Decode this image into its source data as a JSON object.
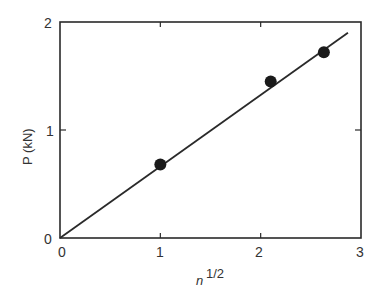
{
  "chart_data": {
    "type": "scatter",
    "title": "",
    "xlabel": "n^{1/2}",
    "xlabel_base": "n",
    "xlabel_sup": "1/2",
    "ylabel": "P (kN)",
    "xlim": [
      0,
      3
    ],
    "ylim": [
      0,
      2
    ],
    "xticks": [
      0,
      1,
      2,
      3
    ],
    "yticks": [
      0,
      1,
      2
    ],
    "grid": false,
    "legend": null,
    "series": [
      {
        "name": "measured",
        "marker": "filled-circle",
        "x": [
          1.0,
          2.1,
          2.63
        ],
        "y": [
          0.68,
          1.45,
          1.72
        ]
      },
      {
        "name": "fit-line",
        "style": "solid-line",
        "x": [
          0,
          2.87
        ],
        "y": [
          0,
          1.9
        ]
      }
    ]
  },
  "axes": {
    "x_tick_labels": [
      "0",
      "1",
      "2",
      "3"
    ],
    "y_tick_labels": [
      "0",
      "1",
      "2"
    ]
  },
  "colors": {
    "ink": "#2a2a2a",
    "background": "#ffffff"
  }
}
